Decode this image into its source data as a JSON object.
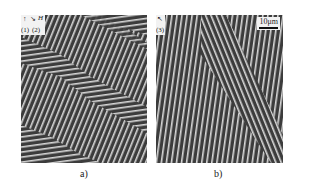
{
  "figure": {
    "panels": [
      {
        "id": "a",
        "caption": "a)",
        "description": "Microscopy image of stripe domains showing chevron/zigzag pattern",
        "inset_labels": {
          "axis_label": "H",
          "label_1": "(1)",
          "label_2": "(2)"
        },
        "colors": {
          "dark": "#3c3c3c",
          "light": "#d8d8d8"
        }
      },
      {
        "id": "b",
        "caption": "b)",
        "description": "Microscopy image of nearly vertical stripe domains with inclined band",
        "inset_labels": {
          "label_3": "(3)"
        },
        "scale_bar": "10μm",
        "colors": {
          "dark": "#3c3c3c",
          "light": "#d8d8d8"
        }
      }
    ]
  }
}
